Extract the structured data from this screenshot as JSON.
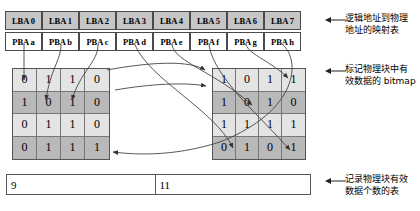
{
  "diagram": {
    "logical_table": {
      "name": "logical-address-row",
      "cells": [
        {
          "label": "LBA 0"
        },
        {
          "label": "LBA 1"
        },
        {
          "label": "LBA 2"
        },
        {
          "label": "LBA 3"
        },
        {
          "label": "LBA 4"
        },
        {
          "label": "LBA 5"
        },
        {
          "label": "LBA 6"
        },
        {
          "label": "LBA 7"
        }
      ]
    },
    "physical_table": {
      "name": "physical-address-row",
      "cells": [
        {
          "label": "PBA a"
        },
        {
          "label": "PBA b"
        },
        {
          "label": "PBA c"
        },
        {
          "label": "PBA d"
        },
        {
          "label": "PBA e"
        },
        {
          "label": "PBA f"
        },
        {
          "label": "PBA g"
        },
        {
          "label": "PBA h"
        }
      ]
    },
    "bitmap_left": {
      "name": "bitmap-grid-left",
      "rows": [
        [
          "0",
          "1",
          "1",
          "0"
        ],
        [
          "1",
          "0",
          "1",
          "0"
        ],
        [
          "0",
          "1",
          "1",
          "0"
        ],
        [
          "0",
          "1",
          "1",
          "1"
        ]
      ]
    },
    "bitmap_right": {
      "name": "bitmap-grid-right",
      "rows": [
        [
          "1",
          "0",
          "1",
          "1"
        ],
        [
          "1",
          "0",
          "1",
          "0"
        ],
        [
          "1",
          "1",
          "1",
          "1"
        ],
        [
          "0",
          "1",
          "0",
          "1"
        ]
      ]
    },
    "count_table": {
      "name": "valid-count-table",
      "cells": [
        "9",
        "11"
      ]
    },
    "annotations": [
      {
        "id": "map-table",
        "text": "逻辑地址到物理\n地址的映射表"
      },
      {
        "id": "bitmap",
        "text": "标记物理块中有\n效数据的 bitmap"
      },
      {
        "id": "count",
        "text": "记录物理块有效\n数据个数的表"
      }
    ]
  }
}
